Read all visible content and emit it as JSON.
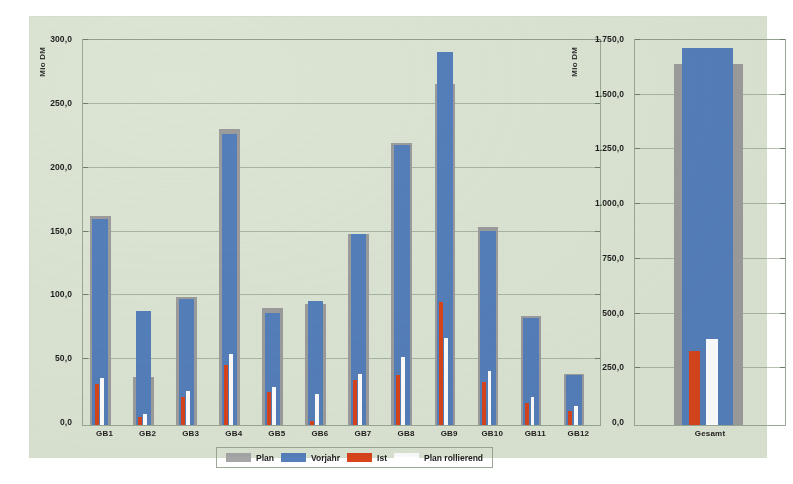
{
  "chart_data": [
    {
      "id": "left",
      "type": "bar",
      "title": "",
      "xlabel": "",
      "ylabel": "Mio DM",
      "ylim": [
        0,
        300
      ],
      "ytick_step": 50,
      "ytick_labels": [
        "300,0",
        "250,0",
        "200,0",
        "150,0",
        "100,0",
        "50,0",
        "0,0"
      ],
      "ytick_values": [
        300,
        250,
        200,
        150,
        100,
        50,
        0
      ],
      "grid": true,
      "legend_position": "bottom",
      "categories": [
        "GB1",
        "GB2",
        "GB3",
        "GB4",
        "GB5",
        "GB6",
        "GB7",
        "GB8",
        "GB9",
        "GB10",
        "GB11",
        "GB12"
      ],
      "series": [
        {
          "name": "Plan",
          "color": "#9d9d9d",
          "values": [
            164,
            38,
            100,
            232,
            92,
            95,
            150,
            221,
            267,
            155,
            85,
            40
          ]
        },
        {
          "name": "Vorjahr",
          "color": "#5580bb",
          "values": [
            161,
            89,
            99,
            228,
            88,
            97,
            150,
            219,
            292,
            152,
            84,
            39
          ]
        },
        {
          "name": "Ist",
          "color": "#d8441c",
          "values": [
            32,
            6,
            22,
            47,
            26,
            3,
            35,
            39,
            96,
            34,
            17,
            11
          ]
        },
        {
          "name": "Plan rollierend",
          "color": "#ffffff",
          "values": [
            37,
            9,
            27,
            56,
            30,
            24,
            40,
            53,
            68,
            42,
            22,
            15
          ]
        }
      ]
    },
    {
      "id": "right",
      "type": "bar",
      "title": "",
      "xlabel": "",
      "ylabel": "Mio DM",
      "ylim": [
        0,
        1750
      ],
      "ytick_step": 250,
      "ytick_labels": [
        "1.750,0",
        "1.500,0",
        "1.250,0",
        "1.000,0",
        "750,0",
        "500,0",
        "250,0",
        "0,0"
      ],
      "ytick_values": [
        1750,
        1500,
        1250,
        1000,
        750,
        500,
        250,
        0
      ],
      "grid": true,
      "categories": [
        "Gesamt"
      ],
      "series": [
        {
          "name": "Plan",
          "color": "#9d9d9d",
          "values": [
            1650
          ]
        },
        {
          "name": "Vorjahr",
          "color": "#5580bb",
          "values": [
            1722
          ]
        },
        {
          "name": "Ist",
          "color": "#d8441c",
          "values": [
            340
          ]
        },
        {
          "name": "Plan rollierend",
          "color": "#ffffff",
          "values": [
            392
          ]
        }
      ]
    }
  ],
  "legend": {
    "items": [
      {
        "label": "Plan",
        "color": "#a6a6a6",
        "swatch": "sw-plan"
      },
      {
        "label": "Vorjahr",
        "color": "#5580bb",
        "swatch": "sw-vorjahr"
      },
      {
        "label": "Ist",
        "color": "#d8441c",
        "swatch": "sw-ist"
      },
      {
        "label": "Plan rollierend",
        "color": "#ffffff",
        "swatch": "sw-roll"
      }
    ]
  },
  "colors": {
    "panel_background": "#dde6d4",
    "frame": "#9aa895",
    "gridline": "#8e9c88",
    "plan": "#9d9d9d",
    "vorjahr": "#5580bb",
    "ist": "#d8441c",
    "plan_rollierend": "#ffffff"
  }
}
